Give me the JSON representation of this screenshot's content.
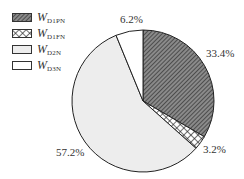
{
  "chart_data": {
    "type": "pie",
    "title": "",
    "start_angle_deg": 0,
    "direction": "clockwise",
    "slices": [
      {
        "name": "W_D1PN",
        "symbol": "W",
        "subscript": "D1PN",
        "value": 33.4,
        "label": "33.4%",
        "fill": "hatch",
        "color": "#555555"
      },
      {
        "name": "W_D1FN",
        "symbol": "W",
        "subscript": "D1FN",
        "value": 3.2,
        "label": "3.2%",
        "fill": "crosshatch",
        "color": "#333333"
      },
      {
        "name": "W_D2N",
        "symbol": "W",
        "subscript": "D2N",
        "value": 57.2,
        "label": "57.2%",
        "fill": "solid",
        "color": "#ededed"
      },
      {
        "name": "W_D3N",
        "symbol": "W",
        "subscript": "D3N",
        "value": 6.2,
        "label": "6.2%",
        "fill": "solid",
        "color": "#ffffff"
      }
    ],
    "legend_position": "top-left",
    "center": [
      143,
      101
    ],
    "radius": 71,
    "label_positions": [
      [
        206,
        47
      ],
      [
        203,
        143
      ],
      [
        56,
        146
      ],
      [
        120,
        13
      ]
    ]
  },
  "legend": {
    "items": [
      {
        "symbol": "W",
        "subscript": "D1PN"
      },
      {
        "symbol": "W",
        "subscript": "D1FN"
      },
      {
        "symbol": "W",
        "subscript": "D2N"
      },
      {
        "symbol": "W",
        "subscript": "D3N"
      }
    ]
  },
  "labels": [
    "33.4%",
    "3.2%",
    "57.2%",
    "6.2%"
  ]
}
